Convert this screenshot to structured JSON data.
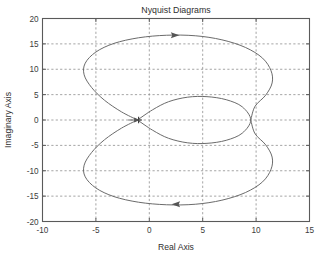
{
  "chart_data": {
    "type": "line",
    "title": "Nyquist Diagrams",
    "xlabel": "Real Axis",
    "ylabel": "Imaginary Axis",
    "xlim": [
      -10,
      15
    ],
    "ylim": [
      -20,
      20
    ],
    "xticks": [
      "-10",
      "-5",
      "0",
      "5",
      "10",
      "15"
    ],
    "xtick_values": [
      -10,
      -5,
      0,
      5,
      10,
      15
    ],
    "yticks": [
      "20",
      "15",
      "10",
      "5",
      "0",
      "-5",
      "-10",
      "-15",
      "-20"
    ],
    "ytick_values": [
      20,
      15,
      10,
      5,
      0,
      -5,
      -10,
      -15,
      -20
    ],
    "grid": true,
    "legend": "none",
    "series": [
      {
        "name": "outer-lobe-upper",
        "description": "Large upper lobe of Nyquist contour, traversed left to right at top",
        "points": [
          [
            -1.1,
            0.0
          ],
          [
            -2.6,
            1.6
          ],
          [
            -4.2,
            3.9
          ],
          [
            -5.4,
            6.4
          ],
          [
            -6.1,
            8.9
          ],
          [
            -6.0,
            11.2
          ],
          [
            -5.0,
            13.4
          ],
          [
            -3.3,
            15.1
          ],
          [
            -1.0,
            16.2
          ],
          [
            1.6,
            16.7
          ],
          [
            4.3,
            16.6
          ],
          [
            6.8,
            15.8
          ],
          [
            9.0,
            14.3
          ],
          [
            10.6,
            12.2
          ],
          [
            11.4,
            9.7
          ],
          [
            11.5,
            7.3
          ],
          [
            10.9,
            4.9
          ],
          [
            9.9,
            2.7
          ],
          [
            9.5,
            0.0
          ]
        ]
      },
      {
        "name": "outer-lobe-lower",
        "description": "Large lower lobe of Nyquist contour, traversed right to left at bottom",
        "points": [
          [
            9.5,
            0.0
          ],
          [
            9.9,
            -2.7
          ],
          [
            10.9,
            -4.9
          ],
          [
            11.5,
            -7.3
          ],
          [
            11.4,
            -9.7
          ],
          [
            10.6,
            -12.2
          ],
          [
            9.0,
            -14.3
          ],
          [
            6.8,
            -15.8
          ],
          [
            4.3,
            -16.6
          ],
          [
            1.6,
            -16.7
          ],
          [
            -1.0,
            -16.2
          ],
          [
            -3.3,
            -15.1
          ],
          [
            -5.0,
            -13.4
          ],
          [
            -6.0,
            -11.2
          ],
          [
            -6.1,
            -8.9
          ],
          [
            -5.4,
            -6.4
          ],
          [
            -4.2,
            -3.9
          ],
          [
            -2.6,
            -1.6
          ],
          [
            -1.1,
            0.0
          ]
        ]
      },
      {
        "name": "inner-lobe",
        "description": "Small inner ellipse lobe centred near Real Axis 4.8",
        "points": [
          [
            -1.1,
            0.0
          ],
          [
            0.3,
            2.0
          ],
          [
            1.8,
            3.6
          ],
          [
            3.6,
            4.5
          ],
          [
            5.4,
            4.6
          ],
          [
            7.2,
            4.0
          ],
          [
            8.7,
            2.6
          ],
          [
            9.5,
            0.0
          ],
          [
            8.7,
            -2.6
          ],
          [
            7.2,
            -4.0
          ],
          [
            5.4,
            -4.6
          ],
          [
            3.6,
            -4.5
          ],
          [
            1.8,
            -3.6
          ],
          [
            0.3,
            -2.0
          ],
          [
            -1.1,
            0.0
          ]
        ]
      }
    ],
    "annotations": [
      {
        "name": "direction-arrow-top",
        "x": 2.3,
        "y": 16.7,
        "direction": "right"
      },
      {
        "name": "direction-arrow-bottom",
        "x": 2.6,
        "y": -16.6,
        "direction": "left"
      },
      {
        "name": "critical-point-marker",
        "x": -1.0,
        "y": 0.0,
        "symbol": "+"
      }
    ],
    "colors": {
      "curve": "#6b6b6b",
      "grid": "#8d8d8d",
      "frame": "#5a5a5a",
      "text": "#3a3a3a",
      "background": "#ffffff"
    }
  },
  "caption": {
    "text": ""
  }
}
